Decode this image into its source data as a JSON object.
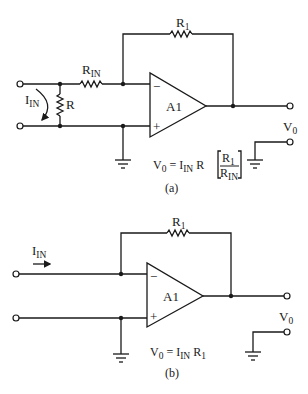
{
  "figure_a": {
    "caption": "(a)",
    "amplifier_label": "A1",
    "inverting_sign": "−",
    "noninverting_sign": "+",
    "feedback_resistor": {
      "main": "R",
      "sub": "1"
    },
    "input_resistor": {
      "main": "R",
      "sub": "IN"
    },
    "shunt_resistor": "R",
    "input_current": {
      "main": "I",
      "sub": "IN"
    },
    "output_label": {
      "main": "V",
      "sub": "0"
    },
    "equation": {
      "lhs_main": "V",
      "lhs_sub": "0",
      "equals": "=",
      "i_main": "I",
      "i_sub": "IN",
      "r": "R",
      "num_main": "R",
      "num_sub": "1",
      "den_main": "R",
      "den_sub": "IN"
    }
  },
  "figure_b": {
    "caption": "(b)",
    "amplifier_label": "A1",
    "inverting_sign": "−",
    "noninverting_sign": "+",
    "feedback_resistor": {
      "main": "R",
      "sub": "1"
    },
    "input_current": {
      "main": "I",
      "sub": "IN"
    },
    "output_label": {
      "main": "V",
      "sub": "0"
    },
    "equation": {
      "lhs_main": "V",
      "lhs_sub": "0",
      "equals": "=",
      "i_main": "I",
      "i_sub": "IN",
      "r_main": "R",
      "r_sub": "1"
    }
  }
}
